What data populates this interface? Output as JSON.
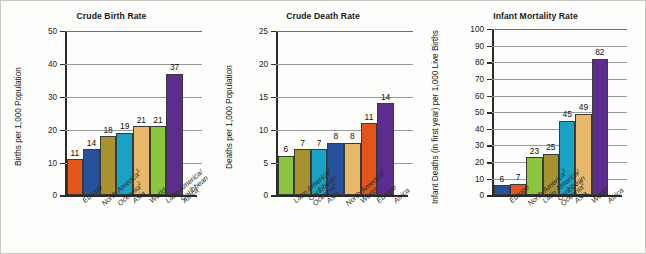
{
  "figure": {
    "background": "#fdfdfb",
    "border_color": "#c9c9c4"
  },
  "palette": {
    "europe": "#E2561C",
    "north_america": "#27519B",
    "oceania": "#A8922F",
    "asia": "#18A2C6",
    "world": "#E9B96B",
    "latin_america": "#8CC63E",
    "africa": "#5B2D8E"
  },
  "footnotes": {
    "marker_1": "1",
    "marker_2": "2"
  },
  "charts": [
    {
      "id": "crude-birth-rate",
      "title": "Crude Birth Rate",
      "ylabel": "Births per 1,000 Population"
    },
    {
      "id": "crude-death-rate",
      "title": "Crude Death Rate",
      "ylabel": "Deaths per 1,000 Population"
    },
    {
      "id": "infant-mortality-rate",
      "title": "Infant Mortality Rate",
      "ylabel": "Infant Deaths (in first year) per 1,000 Live Births"
    }
  ],
  "chart_data": [
    {
      "type": "bar",
      "title": "Crude Birth Rate",
      "xlabel": "",
      "ylabel": "Births per 1,000 Population",
      "ylim": [
        0,
        50
      ],
      "yticks": [
        0,
        10,
        20,
        30,
        40,
        50
      ],
      "grid": true,
      "legend": "none",
      "categories": [
        "Europe",
        "North America¹",
        "Oceania²",
        "Asia",
        "World",
        "Latin America/Caribbean",
        "Africa"
      ],
      "category_lines": [
        [
          "Europe",
          ""
        ],
        [
          "North America",
          ""
        ],
        [
          "Oceania",
          ""
        ],
        [
          "Asia",
          ""
        ],
        [
          "World",
          ""
        ],
        [
          "Latin America/",
          "Caribbean"
        ],
        [
          "Africa",
          ""
        ]
      ],
      "category_sup": [
        "",
        "1",
        "2",
        "",
        "",
        "",
        ""
      ],
      "values": [
        11,
        14,
        18,
        19,
        21,
        21,
        37
      ],
      "colors": [
        "#E2561C",
        "#27519B",
        "#A8922F",
        "#18A2C6",
        "#E9B96B",
        "#8CC63E",
        "#5B2D8E"
      ]
    },
    {
      "type": "bar",
      "title": "Crude Death Rate",
      "xlabel": "",
      "ylabel": "Deaths per 1,000 Population",
      "ylim": [
        0,
        25
      ],
      "yticks": [
        0,
        5,
        10,
        15,
        20,
        25
      ],
      "grid": true,
      "legend": "none",
      "categories": [
        "Latin America/Caribbean",
        "Oceania²",
        "Asia",
        "North America¹",
        "World",
        "Europe",
        "Africa"
      ],
      "category_lines": [
        [
          "Latin America/",
          "Caribbean"
        ],
        [
          "Oceania",
          ""
        ],
        [
          "Asia",
          ""
        ],
        [
          "North America",
          ""
        ],
        [
          "World",
          ""
        ],
        [
          "Europe",
          ""
        ],
        [
          "Africa",
          ""
        ]
      ],
      "category_sup": [
        "",
        "2",
        "",
        "1",
        "",
        "",
        ""
      ],
      "values": [
        6,
        7,
        7,
        8,
        8,
        11,
        14
      ],
      "colors": [
        "#8CC63E",
        "#A8922F",
        "#18A2C6",
        "#27519B",
        "#E9B96B",
        "#E2561C",
        "#5B2D8E"
      ]
    },
    {
      "type": "bar",
      "title": "Infant Mortality Rate",
      "xlabel": "",
      "ylabel": "Infant Deaths (in first year) per 1,000 Live Births",
      "ylim": [
        0,
        100
      ],
      "yticks": [
        0,
        10,
        20,
        30,
        40,
        50,
        60,
        70,
        80,
        90,
        100
      ],
      "grid": true,
      "legend": "none",
      "categories": [
        "Europe",
        "North America¹",
        "Latin America/Caribbean",
        "Oceania²",
        "Asia",
        "World",
        "Africa"
      ],
      "category_lines": [
        [
          "Europe",
          ""
        ],
        [
          "North America",
          ""
        ],
        [
          "Latin America/",
          "Caribbean"
        ],
        [
          "Oceania",
          ""
        ],
        [
          "Asia",
          ""
        ],
        [
          "World",
          ""
        ],
        [
          "Africa",
          ""
        ]
      ],
      "category_sup": [
        "",
        "1",
        "",
        "2",
        "",
        "",
        ""
      ],
      "values": [
        6,
        7,
        23,
        25,
        45,
        49,
        82
      ],
      "colors": [
        "#27519B",
        "#E2561C",
        "#8CC63E",
        "#A8922F",
        "#18A2C6",
        "#E9B96B",
        "#5B2D8E"
      ]
    }
  ]
}
